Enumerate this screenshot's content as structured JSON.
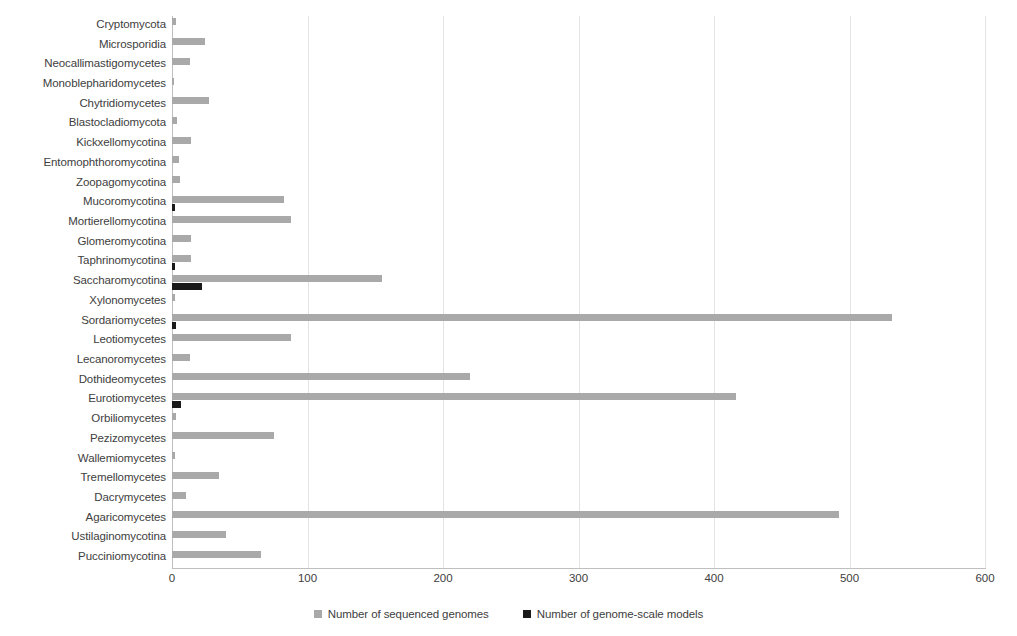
{
  "chart_data": {
    "type": "bar",
    "orientation": "horizontal",
    "title": "",
    "xlabel": "",
    "ylabel": "",
    "xlim": [
      0,
      600
    ],
    "xticks": [
      0,
      100,
      200,
      300,
      400,
      500,
      600
    ],
    "grid": true,
    "grid_axis": "x",
    "legend_position": "bottom",
    "categories": [
      "Cryptomycota",
      "Microsporidia",
      "Neocallimastigomycetes",
      "Monoblepharidomycetes",
      "Chytridiomycetes",
      "Blastocladiomycota",
      "Kickxellomycotina",
      "Entomophthoromycotina",
      "Zoopagomycotina",
      "Mucoromycotina",
      "Mortierellomycotina",
      "Glomeromycotina",
      "Taphrinomycotina",
      "Saccharomycotina",
      "Xylonomycetes",
      "Sordariomycetes",
      "Leotiomycetes",
      "Lecanoromycetes",
      "Dothideomycetes",
      "Eurotiomycetes",
      "Orbiliomycetes",
      "Pezizomycetes",
      "Wallemiomycetes",
      "Tremellomycetes",
      "Dacrymycetes",
      "Agaricomycetes",
      "Ustilaginomycotina",
      "Pucciniomycotina"
    ],
    "series": [
      {
        "name": "Number of sequenced genomes",
        "color": "#a9a9a9",
        "values": [
          3,
          24,
          13,
          1,
          27,
          4,
          14,
          5,
          6,
          83,
          88,
          14,
          14,
          155,
          2,
          531,
          88,
          13,
          220,
          416,
          3,
          75,
          2,
          35,
          10,
          492,
          40,
          66
        ]
      },
      {
        "name": "Number of genome-scale models",
        "color": "#1a1a1a",
        "values": [
          0,
          0,
          0,
          0,
          0,
          0,
          0,
          0,
          0,
          2,
          0,
          0,
          2,
          22,
          0,
          3,
          0,
          0,
          0,
          7,
          0,
          0,
          0,
          0,
          0,
          0,
          0,
          0
        ]
      }
    ]
  },
  "legend": {
    "items": [
      {
        "label": "Number of sequenced genomes",
        "color": "#a9a9a9"
      },
      {
        "label": "Number of genome-scale models",
        "color": "#1a1a1a"
      }
    ]
  }
}
